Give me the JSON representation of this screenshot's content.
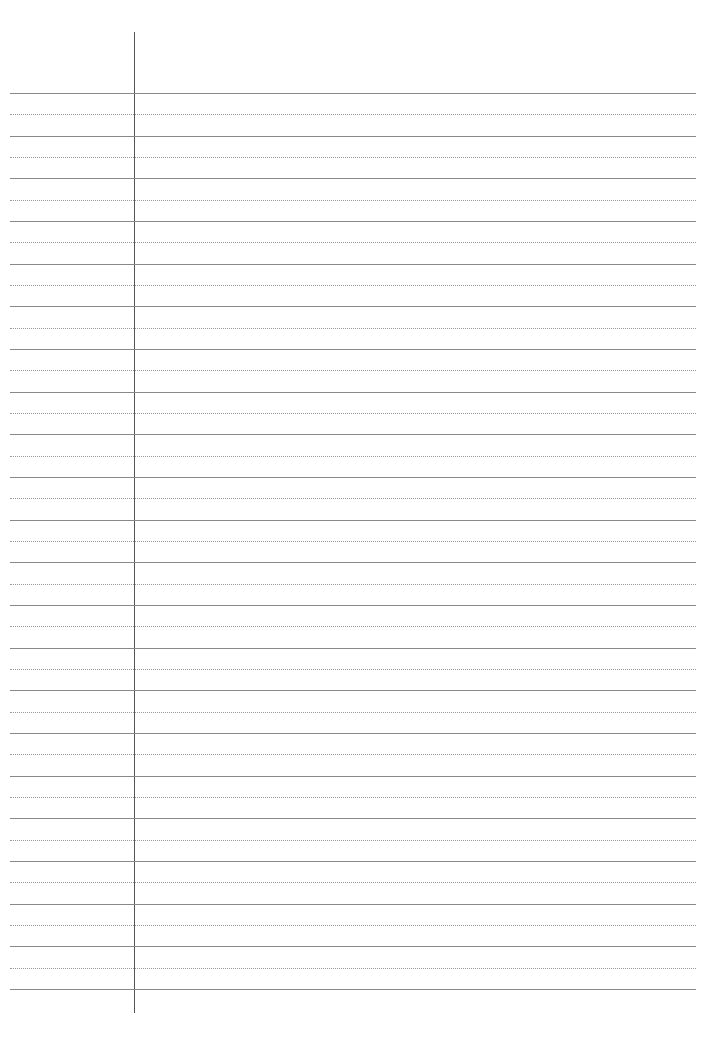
{
  "page": {
    "type": "ruled-paper",
    "margin_line_x": 134,
    "ruled_rows": 21,
    "first_line_y": 93,
    "last_line_y": 989,
    "line_color": "#888888",
    "dotted_color": "#999999",
    "margin_color": "#555555"
  }
}
